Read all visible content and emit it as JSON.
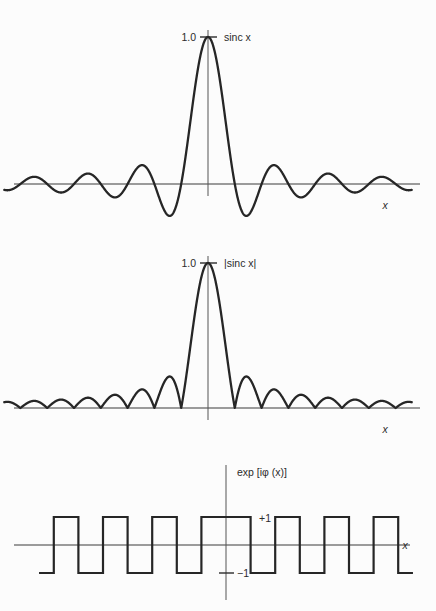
{
  "figure": {
    "background_color": "#fcfcfc",
    "curve_color": "#262626",
    "axis_color": "#3a3a3a"
  },
  "chart_data": [
    {
      "type": "line",
      "title": "",
      "series_label": "sinc x",
      "xlabel": "x",
      "ylabel": "",
      "ytick_labels": [
        "1.0"
      ],
      "ytick_values": [
        1.0
      ],
      "xlim": [
        -7.6,
        7.6
      ],
      "ylim": [
        -0.32,
        1.12
      ],
      "grid": false,
      "legend": "none",
      "annotation": "sinc x",
      "function": "sin(pi*x)/(pi*x)",
      "x": [
        -7.6,
        -7.4,
        -7.2,
        -7.0,
        -6.8,
        -6.6,
        -6.4,
        -6.2,
        -6.0,
        -5.8,
        -5.6,
        -5.4,
        -5.2,
        -5.0,
        -4.8,
        -4.6,
        -4.4,
        -4.2,
        -4.0,
        -3.8,
        -3.6,
        -3.4,
        -3.2,
        -3.0,
        -2.8,
        -2.6,
        -2.4,
        -2.2,
        -2.0,
        -1.8,
        -1.6,
        -1.4,
        -1.2,
        -1.0,
        -0.8,
        -0.6,
        -0.4,
        -0.2,
        0.0,
        0.2,
        0.4,
        0.6,
        0.8,
        1.0,
        1.2,
        1.4,
        1.6,
        1.8,
        2.0,
        2.2,
        2.4,
        2.6,
        2.8,
        3.0,
        3.2,
        3.4,
        3.6,
        3.8,
        4.0,
        4.2,
        4.4,
        4.6,
        4.8,
        5.0,
        5.2,
        5.4,
        5.6,
        5.8,
        6.0,
        6.2,
        6.4,
        6.6,
        6.8,
        7.0,
        7.2,
        7.4,
        7.6
      ],
      "values": [
        -0.0402,
        -0.0,
        0.0417,
        0.0,
        -0.0443,
        -0.0,
        0.0473,
        0.0,
        -0.0505,
        -0.0,
        0.0545,
        0.0,
        -0.0593,
        -0.0,
        0.0651,
        0.0,
        -0.0721,
        -0.0,
        0.0807,
        0.0,
        -0.0914,
        -0.0,
        0.1053,
        0.0,
        -0.1237,
        -0.0,
        0.1378,
        0.0,
        -0.1514,
        0.0,
        0.1891,
        0.0,
        -0.2387,
        0.0,
        0.2339,
        0.5046,
        0.7568,
        0.9355,
        1.0,
        0.9355,
        0.7568,
        0.5046,
        0.2339,
        0.0,
        -0.2387,
        0.0,
        0.1891,
        0.0,
        -0.1514,
        0.0,
        0.1378,
        0.0,
        -0.1237,
        0.0,
        0.1053,
        0.0,
        -0.0914,
        0.0,
        0.0807,
        0.0,
        -0.0721,
        0.0,
        0.0651,
        0.0,
        -0.0593,
        0.0,
        0.0545,
        0.0,
        -0.0505,
        0.0,
        0.0473,
        0.0,
        -0.0443,
        0.0,
        0.0417,
        0.0,
        -0.0402
      ]
    },
    {
      "type": "line",
      "title": "",
      "series_label": "|sinc x|",
      "xlabel": "x",
      "ylabel": "",
      "ytick_labels": [
        "1.0"
      ],
      "ytick_values": [
        1.0
      ],
      "xlim": [
        -7.6,
        7.6
      ],
      "ylim": [
        -0.06,
        1.12
      ],
      "grid": false,
      "legend": "none",
      "annotation": "|sinc x|",
      "function": "abs(sin(pi*x)/(pi*x))"
    },
    {
      "type": "line",
      "title": "",
      "series_label": "exp [iφ (x)]",
      "xlabel": "x",
      "ylabel": "",
      "ytick_labels": [
        "+1",
        "−1"
      ],
      "ytick_values": [
        1,
        -1
      ],
      "xlim": [
        -7.6,
        7.6
      ],
      "ylim": [
        -1.6,
        1.6
      ],
      "grid": false,
      "legend": "none",
      "annotation": "exp [iφ (x)]",
      "function": "sign(sinc x)",
      "segments": [
        {
          "from": -7.6,
          "to": -7.0,
          "value": -1
        },
        {
          "from": -7.0,
          "to": -6.0,
          "value": 1
        },
        {
          "from": -6.0,
          "to": -5.0,
          "value": -1
        },
        {
          "from": -5.0,
          "to": -4.0,
          "value": 1
        },
        {
          "from": -4.0,
          "to": -3.0,
          "value": -1
        },
        {
          "from": -3.0,
          "to": -2.0,
          "value": 1
        },
        {
          "from": -2.0,
          "to": -1.0,
          "value": -1
        },
        {
          "from": -1.0,
          "to": 1.0,
          "value": 1
        },
        {
          "from": 1.0,
          "to": 2.0,
          "value": -1
        },
        {
          "from": 2.0,
          "to": 3.0,
          "value": 1
        },
        {
          "from": 3.0,
          "to": 4.0,
          "value": -1
        },
        {
          "from": 4.0,
          "to": 5.0,
          "value": 1
        },
        {
          "from": 5.0,
          "to": 6.0,
          "value": -1
        },
        {
          "from": 6.0,
          "to": 7.0,
          "value": 1
        },
        {
          "from": 7.0,
          "to": 7.6,
          "value": -1
        }
      ]
    }
  ],
  "panels": [
    {
      "id": "panel-sinc",
      "series_label": "sinc x",
      "peak_tick_label": "1.0",
      "x_axis_label": "x"
    },
    {
      "id": "panel-abs-sinc",
      "series_label": "|sinc x|",
      "peak_tick_label": "1.0",
      "x_axis_label": "x"
    },
    {
      "id": "panel-phase",
      "series_label": "exp [iφ (x)]",
      "plus_one_label": "+1",
      "minus_one_label": "−1",
      "x_axis_label": "x"
    }
  ]
}
